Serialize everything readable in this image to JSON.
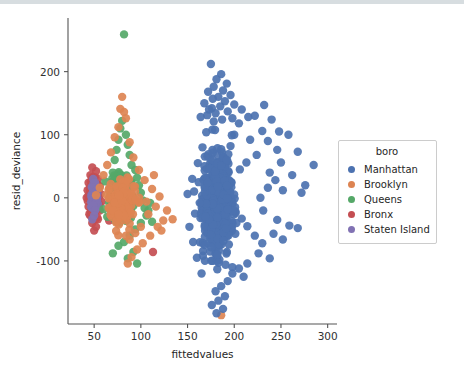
{
  "chart_data": {
    "type": "scatter",
    "title": "",
    "xlabel": "fittedvalues",
    "ylabel": "resid_deviance",
    "xlim": [
      22,
      310
    ],
    "ylim": [
      -200,
      285
    ],
    "xticks": [
      50,
      100,
      150,
      200,
      250,
      300
    ],
    "yticks": [
      200,
      100,
      0,
      -100
    ],
    "xtick_labels": [
      "50",
      "100",
      "150",
      "200",
      "250",
      "300"
    ],
    "ytick_labels": [
      "200",
      "100",
      "0",
      "-100"
    ],
    "grid": false,
    "legend": {
      "title": "boro",
      "position": "right-outside",
      "entries": [
        "Manhattan",
        "Brooklyn",
        "Queens",
        "Bronx",
        "Staten Island"
      ]
    },
    "colors": {
      "Manhattan": "#4c72b0",
      "Brooklyn": "#dd8452",
      "Queens": "#55a868",
      "Bronx": "#c44e52",
      "Staten Island": "#8172b3"
    },
    "marker_size": 5.2,
    "series": [
      {
        "name": "Manhattan",
        "color": "#4c72b0",
        "cluster": {
          "cx": 183,
          "cy": -8,
          "sx": 13,
          "sy": 58,
          "n": 620
        },
        "points": [
          [
            175,
            212
          ],
          [
            186,
            196
          ],
          [
            181,
            188
          ],
          [
            192,
            181
          ],
          [
            178,
            176
          ],
          [
            188,
            170
          ],
          [
            172,
            168
          ],
          [
            196,
            163
          ],
          [
            183,
            160
          ],
          [
            177,
            157
          ],
          [
            190,
            153
          ],
          [
            168,
            150
          ],
          [
            200,
            148
          ],
          [
            185,
            145
          ],
          [
            176,
            142
          ],
          [
            208,
            140
          ],
          [
            193,
            137
          ],
          [
            180,
            134
          ],
          [
            171,
            131
          ],
          [
            215,
            128
          ],
          [
            198,
            126
          ],
          [
            187,
            124
          ],
          [
            178,
            121
          ],
          [
            205,
            118
          ],
          [
            222,
            130
          ],
          [
            240,
            124
          ],
          [
            232,
            147
          ],
          [
            248,
            105
          ],
          [
            258,
            100
          ],
          [
            246,
            76
          ],
          [
            268,
            73
          ],
          [
            285,
            52
          ],
          [
            262,
            36
          ],
          [
            276,
            20
          ],
          [
            272,
            8
          ],
          [
            252,
            12
          ],
          [
            244,
            28
          ],
          [
            238,
            40
          ],
          [
            236,
            16
          ],
          [
            228,
            0
          ],
          [
            231,
            -20
          ],
          [
            246,
            -35
          ],
          [
            259,
            -44
          ],
          [
            268,
            -48
          ],
          [
            242,
            -57
          ],
          [
            252,
            -66
          ],
          [
            230,
            -72
          ],
          [
            222,
            -60
          ],
          [
            214,
            -45
          ],
          [
            208,
            -33
          ],
          [
            226,
            -88
          ],
          [
            238,
            -96
          ],
          [
            214,
            -104
          ],
          [
            205,
            -112
          ],
          [
            198,
            -120
          ],
          [
            210,
            -125
          ],
          [
            193,
            -132
          ],
          [
            186,
            -140
          ],
          [
            180,
            -148
          ],
          [
            190,
            -156
          ],
          [
            183,
            -163
          ],
          [
            176,
            -170
          ],
          [
            188,
            -176
          ],
          [
            181,
            -183
          ],
          [
            165,
            -120
          ],
          [
            160,
            -95
          ],
          [
            156,
            -70
          ],
          [
            152,
            -46
          ],
          [
            158,
            -25
          ],
          [
            150,
            6
          ],
          [
            155,
            30
          ],
          [
            161,
            55
          ],
          [
            166,
            80
          ],
          [
            170,
            104
          ],
          [
            164,
            128
          ],
          [
            173,
            140
          ],
          [
            157,
            10
          ],
          [
            163,
            -8
          ],
          [
            169,
            -30
          ],
          [
            217,
            92
          ],
          [
            224,
            68
          ],
          [
            213,
            56
          ],
          [
            206,
            45
          ],
          [
            200,
            100
          ],
          [
            196,
            82
          ],
          [
            192,
            60
          ],
          [
            230,
            106
          ],
          [
            236,
            90
          ],
          [
            250,
            56
          ]
        ]
      },
      {
        "name": "Brooklyn",
        "color": "#dd8452",
        "cluster": {
          "cx": 80,
          "cy": -5,
          "sx": 12,
          "sy": 34,
          "n": 130
        },
        "points": [
          [
            80,
            160
          ],
          [
            78,
            141
          ],
          [
            82,
            136
          ],
          [
            84,
            126
          ],
          [
            76,
            112
          ],
          [
            72,
            96
          ],
          [
            88,
            88
          ],
          [
            68,
            72
          ],
          [
            92,
            64
          ],
          [
            64,
            52
          ],
          [
            98,
            44
          ],
          [
            60,
            36
          ],
          [
            104,
            28
          ],
          [
            112,
            14
          ],
          [
            120,
            2
          ],
          [
            116,
            -14
          ],
          [
            108,
            -26
          ],
          [
            124,
            -36
          ],
          [
            100,
            -46
          ],
          [
            94,
            -56
          ],
          [
            88,
            -66
          ],
          [
            110,
            -60
          ],
          [
            102,
            -72
          ],
          [
            96,
            -82
          ],
          [
            84,
            -60
          ],
          [
            128,
            -20
          ],
          [
            134,
            -34
          ],
          [
            56,
            16
          ],
          [
            52,
            4
          ],
          [
            90,
            -94
          ],
          [
            118,
            -46
          ],
          [
            106,
            -6
          ],
          [
            114,
            36
          ],
          [
            122,
            -52
          ],
          [
            86,
            -104
          ],
          [
            186,
            -186
          ]
        ]
      },
      {
        "name": "Queens",
        "color": "#55a868",
        "cluster": {
          "cx": 79,
          "cy": -2,
          "sx": 8,
          "sy": 30,
          "n": 300
        },
        "points": [
          [
            82,
            259
          ],
          [
            80,
            122
          ],
          [
            78,
            110
          ],
          [
            84,
            100
          ],
          [
            76,
            92
          ],
          [
            86,
            84
          ],
          [
            74,
            76
          ],
          [
            88,
            68
          ],
          [
            72,
            60
          ],
          [
            90,
            52
          ],
          [
            94,
            44
          ],
          [
            70,
            40
          ],
          [
            96,
            32
          ],
          [
            98,
            20
          ],
          [
            68,
            16
          ],
          [
            100,
            8
          ],
          [
            102,
            -4
          ],
          [
            66,
            -8
          ],
          [
            104,
            -16
          ],
          [
            106,
            -28
          ],
          [
            64,
            -30
          ],
          [
            100,
            -40
          ],
          [
            94,
            -50
          ],
          [
            88,
            -60
          ],
          [
            82,
            -70
          ],
          [
            76,
            -76
          ],
          [
            92,
            -86
          ],
          [
            86,
            -96
          ],
          [
            108,
            -20
          ],
          [
            110,
            -8
          ],
          [
            96,
            -104
          ],
          [
            112,
            -38
          ],
          [
            62,
            26
          ],
          [
            60,
            -18
          ],
          [
            70,
            -88
          ]
        ]
      },
      {
        "name": "Bronx",
        "color": "#c44e52",
        "cluster": {
          "cx": 50,
          "cy": 2,
          "sx": 4,
          "sy": 22,
          "n": 150
        },
        "points": [
          [
            48,
            48
          ],
          [
            52,
            42
          ],
          [
            46,
            36
          ],
          [
            54,
            30
          ],
          [
            44,
            24
          ],
          [
            56,
            18
          ],
          [
            43,
            12
          ],
          [
            57,
            6
          ],
          [
            42,
            0
          ],
          [
            58,
            -6
          ],
          [
            44,
            -14
          ],
          [
            56,
            -20
          ],
          [
            46,
            -28
          ],
          [
            54,
            -34
          ],
          [
            48,
            -40
          ],
          [
            52,
            -46
          ],
          [
            50,
            -52
          ],
          [
            113,
            -86
          ],
          [
            70,
            26
          ],
          [
            66,
            -36
          ]
        ]
      },
      {
        "name": "Staten Island",
        "color": "#8172b3",
        "cluster": {
          "cx": 50,
          "cy": 0,
          "sx": 3,
          "sy": 16,
          "n": 90
        },
        "points": [
          [
            49,
            30
          ],
          [
            51,
            24
          ],
          [
            48,
            16
          ],
          [
            52,
            10
          ],
          [
            47,
            2
          ],
          [
            53,
            -4
          ],
          [
            49,
            -12
          ],
          [
            51,
            -20
          ],
          [
            50,
            -28
          ],
          [
            48,
            -34
          ]
        ]
      }
    ]
  }
}
